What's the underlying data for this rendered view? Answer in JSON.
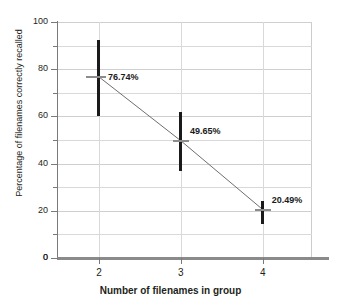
{
  "chart_data": {
    "type": "line",
    "title": "",
    "subtitle": "",
    "xlabel": "Number of filenames in group",
    "ylabel": "Percentage of filenames correctly recalled",
    "x": [
      2,
      3,
      4
    ],
    "categories": [
      "2",
      "3",
      "4"
    ],
    "values": [
      76.74,
      49.65,
      20.49
    ],
    "point_labels": [
      "76.74%",
      "49.65%",
      "20.49%"
    ],
    "error_bars": [
      {
        "x": 2,
        "value": 76.74,
        "low": 60.3,
        "high": 92.3
      },
      {
        "x": 3,
        "value": 49.65,
        "low": 37.0,
        "high": 61.8
      },
      {
        "x": 4,
        "value": 20.49,
        "low": 14.2,
        "high": 24.2
      }
    ],
    "xlim": [
      1.5,
      4.6
    ],
    "ylim": [
      0,
      100
    ],
    "y_major_ticks": [
      0,
      20,
      40,
      60,
      80,
      100
    ],
    "y_minor_ticks": [
      10,
      30,
      50,
      70,
      90
    ],
    "y_tick_labels": [
      "0",
      "20",
      "40",
      "60",
      "80",
      "100"
    ],
    "x_ticks": [
      2,
      3,
      4
    ],
    "x_tick_labels": [
      "2",
      "3",
      "4"
    ],
    "grid": true,
    "legend": "none",
    "colors": {
      "error_bar": "#1a1a1a",
      "mean_marker": "#8c8c8c",
      "trend_line": "#6e6e6e",
      "grid": "#d9d9d9",
      "axis": "#7a7a7a",
      "baseline": "#8a8a8a",
      "text": "#231f20",
      "background": "#ffffff"
    }
  },
  "axes": {
    "y_labels": [
      "100",
      "80",
      "60",
      "40",
      "20",
      "0"
    ],
    "x_labels": [
      "2",
      "3",
      "4"
    ],
    "y_title": "Percentage of filenames correctly recalled",
    "x_title": "Number of filenames in group"
  },
  "labels": {
    "p1": "76.74%",
    "p2": "49.65%",
    "p3": "20.49%"
  }
}
